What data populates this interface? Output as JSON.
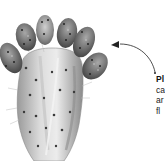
{
  "illustration": {
    "subject": "prickly-pear-cactus",
    "style": "grayscale watercolor",
    "colors": {
      "background": "#ffffff",
      "pad_light": "#e4e4e4",
      "pad_mid": "#b8b8b8",
      "pad_dark": "#6e6e6e",
      "fruit_dark": "#4a4a4a",
      "fruit_mid": "#7d7d7d",
      "areole": "#3a3a3a",
      "arrow": "#222222"
    }
  },
  "annotation": {
    "lines": [
      "Pl",
      "ca",
      "ar",
      "fl"
    ]
  }
}
